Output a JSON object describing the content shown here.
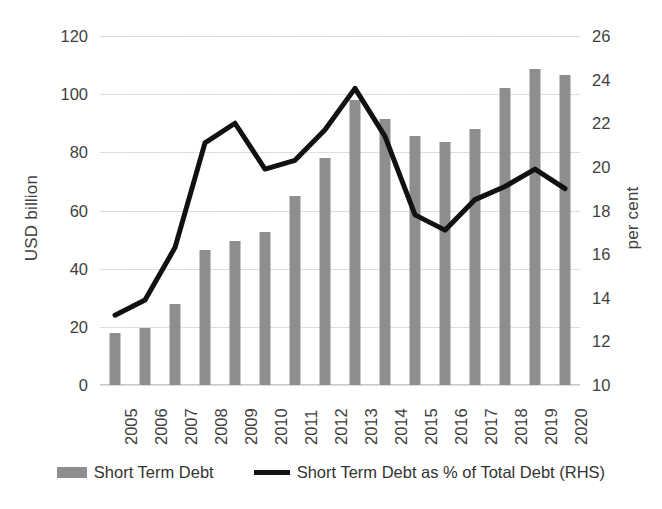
{
  "chart_data": {
    "type": "bar",
    "title": "",
    "subtitle": "",
    "xlabel": "",
    "ylabel": "USD billion",
    "y2label": "per cent",
    "ylim": [
      0,
      120
    ],
    "y2lim": [
      10,
      26
    ],
    "yticks": [
      0,
      20,
      40,
      60,
      80,
      100,
      120
    ],
    "y2ticks": [
      10,
      12,
      14,
      16,
      18,
      20,
      22,
      24,
      26
    ],
    "grid": true,
    "legend_position": "bottom",
    "categories": [
      "2005",
      "2006",
      "2007",
      "2008",
      "2009",
      "2010",
      "2011",
      "2012",
      "2013",
      "2014",
      "2015",
      "2016",
      "2017",
      "2018",
      "2019",
      "2020"
    ],
    "series": [
      {
        "name": "Short Term Debt",
        "type": "bar",
        "axis": "left",
        "units": "USD billion",
        "color": "#8e8e8e",
        "values": [
          18.0,
          19.6,
          28.0,
          46.5,
          49.5,
          52.5,
          65.0,
          78.0,
          98.0,
          91.5,
          85.5,
          83.5,
          88.0,
          102.0,
          108.5,
          106.5
        ]
      },
      {
        "name": "Short Term Debt as % of Total Debt (RHS)",
        "type": "line",
        "axis": "right",
        "units": "per cent",
        "color": "#111111",
        "values": [
          13.2,
          13.9,
          16.3,
          21.1,
          22.0,
          19.9,
          20.3,
          21.7,
          23.6,
          21.4,
          17.8,
          17.1,
          18.5,
          19.1,
          19.9,
          19.0
        ]
      }
    ]
  },
  "axes": {
    "left": {
      "title": "USD billion",
      "ticks": [
        "0",
        "20",
        "40",
        "60",
        "80",
        "100",
        "120"
      ]
    },
    "right": {
      "title": "per cent",
      "ticks": [
        "10",
        "12",
        "14",
        "16",
        "18",
        "20",
        "22",
        "24",
        "26"
      ]
    },
    "x": {
      "ticks": [
        "2005",
        "2006",
        "2007",
        "2008",
        "2009",
        "2010",
        "2011",
        "2012",
        "2013",
        "2014",
        "2015",
        "2016",
        "2017",
        "2018",
        "2019",
        "2020"
      ]
    }
  },
  "legend": {
    "items": [
      {
        "label": "Short Term Debt",
        "marker": "bar-swatch",
        "color": "#8e8e8e"
      },
      {
        "label": "Short Term Debt as % of Total Debt (RHS)",
        "marker": "line-swatch",
        "color": "#111111"
      }
    ]
  }
}
